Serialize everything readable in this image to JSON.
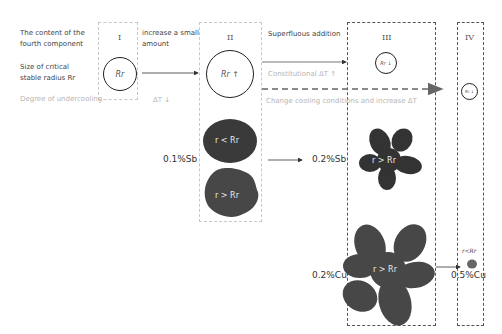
{
  "row_labels": {
    "content": "The content of the fourth component",
    "content_line1": "The content of the",
    "content_line2": "fourth component",
    "critical_radius_line1": "Size of critical",
    "critical_radius_line2": "stable radius Rr",
    "undercooling": "Degree of undercooling"
  },
  "stages": [
    {
      "id": "I",
      "numeral": "I",
      "radius_label": "Rr",
      "undercooling": "ΔT ↓"
    },
    {
      "id": "II",
      "numeral": "II",
      "radius_label": "Rr ↑"
    },
    {
      "id": "III",
      "numeral": "III",
      "radius_label": "Rr ↓"
    },
    {
      "id": "IV",
      "numeral": "IV",
      "radius_label": "Rr ↓"
    }
  ],
  "transitions": {
    "i_to_ii_line1": "increase a small",
    "i_to_ii_line2": "amount",
    "ii_to_iii": "Superfluous addition",
    "constitutional": "Constitutional ΔT ↑",
    "cooling_change": "Change cooling conditions and increase ΔT"
  },
  "samples": {
    "sb_low": "0.1%Sb",
    "sb_high": "0.2%Sb",
    "cu_low": "0.2%Cu",
    "cu_high": "0.5%Cu",
    "grain_small": "r < Rr",
    "grain_large": "r > Rr",
    "grain_tiny": "r<Rr"
  },
  "colors": {
    "grain_dark": "#3d3d3d",
    "grain_mid": "#555555",
    "box_light": "#c8c8c8",
    "box_dark": "#555555"
  }
}
